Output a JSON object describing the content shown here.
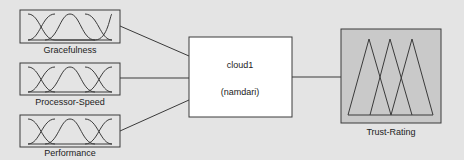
{
  "diagram": {
    "type": "fuzzy-inference-system",
    "colors": {
      "background": "#e4e4e4",
      "stroke": "#3a3a3a",
      "input_box_fill": "#e4e4e4",
      "system_box_fill": "#ffffff",
      "output_box_fill": "#c9c9c9"
    },
    "inputs": [
      {
        "label": "Gracefulness",
        "membership_shape": "gaussian-3"
      },
      {
        "label": "Processor-Speed",
        "membership_shape": "gaussian-3"
      },
      {
        "label": "Performance",
        "membership_shape": "gaussian-3"
      }
    ],
    "system": {
      "name": "cloud1",
      "subtitle": "(namdari)"
    },
    "output": {
      "label": "Trust-Rating",
      "membership_shape": "triangular-3"
    }
  }
}
